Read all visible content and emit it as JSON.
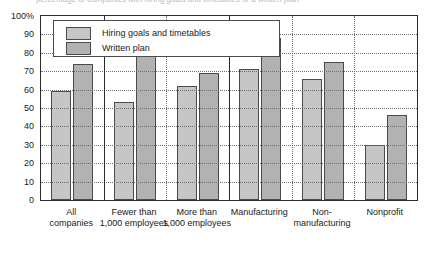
{
  "caption_partial": "percentage of companies with hiring goals and timetables or a written plan",
  "chart_data": {
    "type": "bar",
    "title": "",
    "xlabel": "",
    "ylabel": "",
    "ylim": [
      0,
      100
    ],
    "yticks": [
      "100%",
      "90",
      "80",
      "70",
      "60",
      "50",
      "40",
      "30",
      "20",
      "10",
      "0"
    ],
    "grid": true,
    "legend_position": "top-left-inside",
    "categories": [
      "All companies",
      "Fewer than 1,000 employees",
      "More than 1,000 employees",
      "Manufacturing",
      "Non-manufacturing",
      "Nonprofit"
    ],
    "category_lines": [
      [
        "All",
        "companies"
      ],
      [
        "Fewer than",
        "1,000 employees"
      ],
      [
        "More than",
        "1,000 employees"
      ],
      [
        "Manufacturing",
        ""
      ],
      [
        "Non-",
        "manufacturing"
      ],
      [
        "Nonprofit",
        ""
      ]
    ],
    "series": [
      {
        "name": "Hiring goals and timetables",
        "color": "#c6c6c6",
        "values": [
          59,
          53,
          62,
          71,
          66,
          30
        ]
      },
      {
        "name": "Written plan",
        "color": "#b2b2b2",
        "values": [
          74,
          78,
          69,
          88,
          75,
          46
        ]
      }
    ]
  }
}
